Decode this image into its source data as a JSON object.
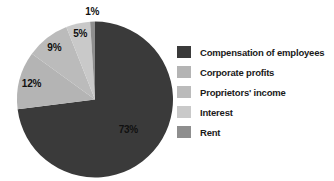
{
  "chart_data": {
    "type": "pie",
    "title": "",
    "legend_position": "right",
    "direction": "clockwise",
    "start_angle_deg": 0,
    "label_color": "#101010",
    "background_color": "#ffffff",
    "slices": [
      {
        "label": "Compensation of employees",
        "value": 73,
        "pct_label": "73%",
        "color": "#3a3a3a",
        "label_r": 0.57
      },
      {
        "label": "Corporate profits",
        "value": 12,
        "pct_label": "12%",
        "color": "#b4b4b4",
        "label_r": 0.84
      },
      {
        "label": "Proprietors' income",
        "value": 9,
        "pct_label": "9%",
        "color": "#bbbbbb",
        "label_r": 0.85
      },
      {
        "label": "Interest",
        "value": 5,
        "pct_label": "5%",
        "color": "#c9c9c9",
        "label_r": 0.87
      },
      {
        "label": "Rent",
        "value": 1,
        "pct_label": "1%",
        "color": "#8e8e8e",
        "label_r": 1.14
      }
    ]
  }
}
